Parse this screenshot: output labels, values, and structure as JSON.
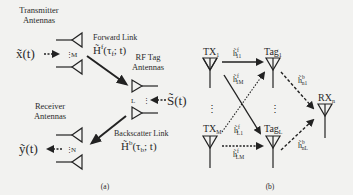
{
  "panel_a": {
    "caption": "(a)",
    "transmitter": {
      "title_line1": "Transmitter",
      "title_line2": "Antennas",
      "count_label": "M",
      "signal": "x̃(t)"
    },
    "forward_link": {
      "title": "Forward Link",
      "symbol": "H̃ᶠ(τ_f; t)",
      "symbol_main": "H̃",
      "symbol_sup": "f",
      "symbol_args": "(τ",
      "symbol_sub": "f",
      "symbol_tail": "; t)"
    },
    "tag": {
      "title_line1": "RF Tag",
      "title_line2": "Antennas",
      "count_label": "L",
      "signal": "S̃(t)"
    },
    "backscatter_link": {
      "title": "Backscatter Link",
      "symbol_main": "H̃",
      "symbol_sup": "b",
      "symbol_args": "(τ",
      "symbol_sub": "b",
      "symbol_tail": "; t)"
    },
    "receiver": {
      "title_line1": "Receiver",
      "title_line2": "Antennas",
      "count_label": "N",
      "signal": "ỹ(t)"
    }
  },
  "panel_b": {
    "caption": "(b)",
    "nodes": {
      "tx1": {
        "label": "TX",
        "sub": "1"
      },
      "txM": {
        "label": "TX",
        "sub": "M"
      },
      "tag1": {
        "label": "Tag",
        "sub": "1"
      },
      "tagL": {
        "label": "Tag",
        "sub": "L"
      },
      "rx": {
        "label": "RX",
        "sub": "n"
      }
    },
    "links": {
      "h11": {
        "base": "h̃",
        "sup": "f",
        "sub": "11"
      },
      "h1M": {
        "base": "h̃",
        "sup": "f",
        "sub": "1M"
      },
      "hL1": {
        "base": "h̃",
        "sup": "f",
        "sub": "L1"
      },
      "hLM": {
        "base": "h̃",
        "sup": "f",
        "sub": "LM"
      },
      "hn1": {
        "base": "h̃",
        "sup": "b",
        "sub": "n1"
      },
      "hnL": {
        "base": "h̃",
        "sup": "b",
        "sub": "nL"
      }
    },
    "ellipsis": "⋮"
  }
}
